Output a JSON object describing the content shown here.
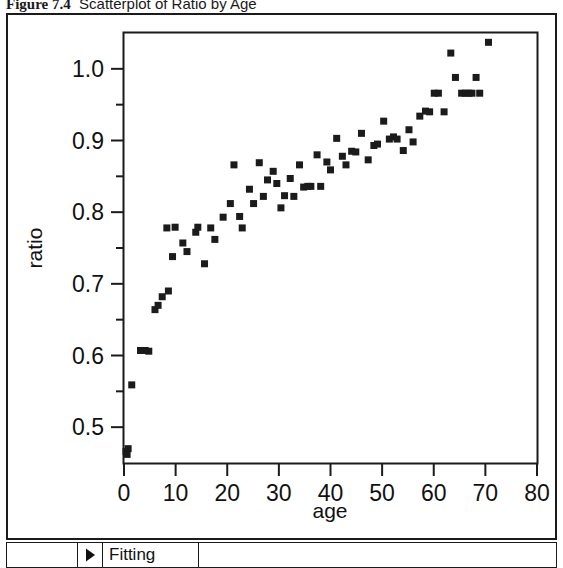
{
  "caption": {
    "label": "Figure 7.4",
    "text": "Scatterplot of Ratio by Age"
  },
  "toolbar": {
    "disclosure_icon": "triangle-right-icon",
    "fitting_label": "Fitting"
  },
  "colors": {
    "marker": "#1b1b1b",
    "axis": "#1b1b1b",
    "frame": "#1b1b1b",
    "background": "#ffffff"
  },
  "chart_data": {
    "type": "scatter",
    "title": "Scatterplot of Ratio by Age",
    "xlabel": "age",
    "ylabel": "ratio",
    "xlim": [
      0,
      80
    ],
    "ylim": [
      0.45,
      1.05
    ],
    "grid": false,
    "legend": null,
    "x_major_ticks": [
      0,
      10,
      20,
      30,
      40,
      50,
      60,
      70,
      80
    ],
    "x_tick_labels": [
      "0",
      "10",
      "20",
      "30",
      "40",
      "50",
      "60",
      "70",
      "80"
    ],
    "x_minor_ticks": [
      5,
      15,
      25,
      35,
      45,
      55,
      65,
      75
    ],
    "y_major_ticks": [
      0.5,
      0.6,
      0.7,
      0.8,
      0.9,
      1.0
    ],
    "y_tick_labels": [
      "0.5",
      "0.6",
      "0.7",
      "0.8",
      "0.9",
      "1.0"
    ],
    "y_minor_ticks": [
      0.55,
      0.65,
      0.75,
      0.85,
      0.95
    ],
    "marker": "square",
    "marker_size": 7,
    "points": [
      [
        0.4,
        0.466
      ],
      [
        0.8,
        0.47
      ],
      [
        0.6,
        0.462
      ],
      [
        1.5,
        0.559
      ],
      [
        3.2,
        0.607
      ],
      [
        4.1,
        0.607
      ],
      [
        4.8,
        0.606
      ],
      [
        6.0,
        0.664
      ],
      [
        6.6,
        0.67
      ],
      [
        7.4,
        0.682
      ],
      [
        8.6,
        0.69
      ],
      [
        9.4,
        0.738
      ],
      [
        8.3,
        0.778
      ],
      [
        9.9,
        0.779
      ],
      [
        11.4,
        0.757
      ],
      [
        12.2,
        0.745
      ],
      [
        13.9,
        0.772
      ],
      [
        14.3,
        0.779
      ],
      [
        15.6,
        0.728
      ],
      [
        16.8,
        0.778
      ],
      [
        17.6,
        0.762
      ],
      [
        19.2,
        0.793
      ],
      [
        20.6,
        0.812
      ],
      [
        21.3,
        0.866
      ],
      [
        22.4,
        0.794
      ],
      [
        22.9,
        0.778
      ],
      [
        24.3,
        0.832
      ],
      [
        25.1,
        0.812
      ],
      [
        26.2,
        0.869
      ],
      [
        27.0,
        0.822
      ],
      [
        27.8,
        0.845
      ],
      [
        28.9,
        0.857
      ],
      [
        29.6,
        0.84
      ],
      [
        30.4,
        0.806
      ],
      [
        31.1,
        0.823
      ],
      [
        32.2,
        0.847
      ],
      [
        32.9,
        0.822
      ],
      [
        34.0,
        0.866
      ],
      [
        34.8,
        0.835
      ],
      [
        35.6,
        0.836
      ],
      [
        36.2,
        0.836
      ],
      [
        37.4,
        0.88
      ],
      [
        38.1,
        0.836
      ],
      [
        39.3,
        0.87
      ],
      [
        40.0,
        0.859
      ],
      [
        41.2,
        0.903
      ],
      [
        42.3,
        0.878
      ],
      [
        43.0,
        0.866
      ],
      [
        44.1,
        0.885
      ],
      [
        44.9,
        0.884
      ],
      [
        46.0,
        0.91
      ],
      [
        47.3,
        0.873
      ],
      [
        48.4,
        0.893
      ],
      [
        49.1,
        0.895
      ],
      [
        50.3,
        0.927
      ],
      [
        51.4,
        0.902
      ],
      [
        52.2,
        0.905
      ],
      [
        52.9,
        0.902
      ],
      [
        54.1,
        0.886
      ],
      [
        55.2,
        0.915
      ],
      [
        56.0,
        0.898
      ],
      [
        57.3,
        0.934
      ],
      [
        58.4,
        0.941
      ],
      [
        59.2,
        0.94
      ],
      [
        60.1,
        0.966
      ],
      [
        60.9,
        0.966
      ],
      [
        62.0,
        0.94
      ],
      [
        63.3,
        1.022
      ],
      [
        64.2,
        0.988
      ],
      [
        65.4,
        0.966
      ],
      [
        66.1,
        0.966
      ],
      [
        66.8,
        0.966
      ],
      [
        67.4,
        0.966
      ],
      [
        68.2,
        0.988
      ],
      [
        68.9,
        0.966
      ],
      [
        70.6,
        1.037
      ]
    ]
  }
}
